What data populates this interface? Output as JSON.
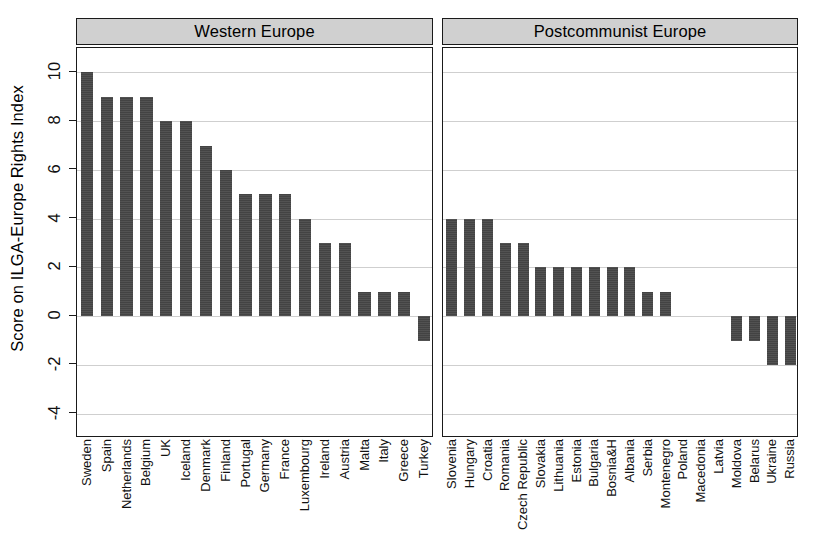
{
  "chart_data": {
    "type": "bar",
    "title": "",
    "xlabel": "",
    "ylabel": "Score on ILGA-Europe Rights Index",
    "ylim": [
      -5,
      11
    ],
    "yticks": [
      -4,
      -2,
      0,
      2,
      4,
      6,
      8,
      10
    ],
    "grid": true,
    "legend": "none",
    "panels": [
      {
        "label": "Western Europe",
        "categories": [
          "Sweden",
          "Spain",
          "Netherlands",
          "Belgium",
          "UK",
          "Iceland",
          "Denmark",
          "Finland",
          "Portugal",
          "Germany",
          "France",
          "Luxembourg",
          "Ireland",
          "Austria",
          "Malta",
          "Italy",
          "Greece",
          "Turkey"
        ],
        "values": [
          10,
          9,
          9,
          9,
          8,
          8,
          7,
          6,
          5,
          5,
          5,
          4,
          3,
          3,
          1,
          1,
          1,
          -1
        ]
      },
      {
        "label": "Postcommunist Europe",
        "categories": [
          "Slovenia",
          "Hungary",
          "Croatia",
          "Romania",
          "Czech Republic",
          "Slovakia",
          "Lithuania",
          "Estonia",
          "Bulgaria",
          "Bosnia&H",
          "Albania",
          "Serbia",
          "Montenegro",
          "Poland",
          "Macedonia",
          "Latvia",
          "Moldova",
          "Belarus",
          "Ukraine",
          "Russia"
        ],
        "values": [
          4,
          4,
          4,
          3,
          3,
          2,
          2,
          2,
          2,
          2,
          2,
          1,
          1,
          0,
          0,
          0,
          -1,
          -1,
          -2,
          -2
        ]
      }
    ],
    "colors": {
      "bar": "#434343",
      "strip_background": "#d0d0d0",
      "grid": "#cfcfcf",
      "axis": "#1a1a1a",
      "background": "#ffffff"
    }
  }
}
